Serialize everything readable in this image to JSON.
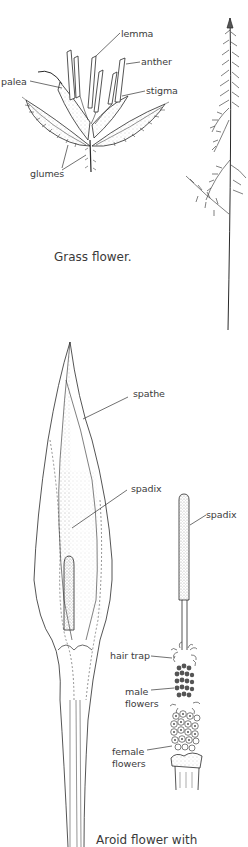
{
  "figure_1": {
    "caption": "Grass flower.",
    "labels": {
      "lemma": "lemma",
      "anther": "anther",
      "palea": "palea",
      "stigma": "stigma",
      "glumes": "glumes"
    }
  },
  "figure_2": {
    "caption": "Aroid flower with",
    "labels": {
      "spathe": "spathe",
      "spadix_left": "spadix",
      "spadix_right": "spadix",
      "hair_trap": "hair trap",
      "male_flowers_1": "male",
      "male_flowers_2": "flowers",
      "female_flowers_1": "female",
      "female_flowers_2": "flowers"
    }
  },
  "colors": {
    "ink": "#2a2a2a",
    "stipple": "#bdbdbd",
    "background": "#ffffff"
  }
}
